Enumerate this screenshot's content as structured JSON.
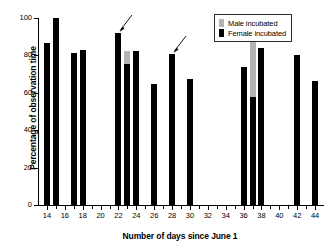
{
  "chart_data": {
    "type": "bar",
    "title": "",
    "xlabel": "Number of days since June 1",
    "ylabel": "Percentage of observation time",
    "xlim": [
      13,
      45
    ],
    "ylim": [
      0,
      100
    ],
    "grid": false,
    "stacked": true,
    "x_major_ticks": [
      14,
      16,
      18,
      20,
      22,
      24,
      26,
      28,
      30,
      32,
      34,
      36,
      38,
      40,
      42,
      44
    ],
    "x_minor_ticks": [
      15,
      17,
      19,
      21,
      23,
      25,
      27,
      29,
      31,
      33,
      35,
      37,
      39,
      41,
      43
    ],
    "x_tick_labels": [
      "14",
      "16",
      "18",
      "20",
      "22",
      "24",
      "26",
      "28",
      "30",
      "32",
      "34",
      "36",
      "38",
      "40",
      "42",
      "44"
    ],
    "y_ticks": [
      0,
      20,
      40,
      60,
      80,
      100
    ],
    "y_tick_labels": [
      "0",
      "20",
      "40",
      "60",
      "80",
      "100"
    ],
    "legend": {
      "position": "top-right",
      "entries": [
        {
          "name": "Male incubated",
          "color": "#b4b4b4"
        },
        {
          "name": "Female incubated",
          "color": "#000000"
        }
      ]
    },
    "series": [
      {
        "name": "Female incubated",
        "color": "#000000"
      },
      {
        "name": "Male incubated",
        "color": "#b4b4b4"
      }
    ],
    "categories": [
      14,
      15,
      17,
      18,
      22,
      23,
      24,
      26,
      28,
      30,
      36,
      37,
      38,
      42,
      44
    ],
    "bars": [
      {
        "day": 14,
        "female": 86.5,
        "male": 0,
        "total": 86.5
      },
      {
        "day": 15,
        "female": 100,
        "male": 0,
        "total": 100
      },
      {
        "day": 17,
        "female": 81.5,
        "male": 0,
        "total": 81.5
      },
      {
        "day": 18,
        "female": 83,
        "male": 0,
        "total": 83
      },
      {
        "day": 22,
        "female": 92,
        "male": 0,
        "total": 92
      },
      {
        "day": 23,
        "female": 75.5,
        "male": 7,
        "total": 82.5
      },
      {
        "day": 24,
        "female": 82.5,
        "male": 0,
        "total": 82.5
      },
      {
        "day": 26,
        "female": 64.5,
        "male": 0,
        "total": 64.5
      },
      {
        "day": 28,
        "female": 80.5,
        "male": 0,
        "total": 80.5
      },
      {
        "day": 30,
        "female": 67.5,
        "male": 0,
        "total": 67.5
      },
      {
        "day": 36,
        "female": 74,
        "male": 0,
        "total": 74
      },
      {
        "day": 37,
        "female": 58,
        "male": 30,
        "total": 88
      },
      {
        "day": 38,
        "female": 84,
        "male": 0,
        "total": 84
      },
      {
        "day": 42,
        "female": 80,
        "male": 0,
        "total": 80
      },
      {
        "day": 44,
        "female": 66.5,
        "male": 0,
        "total": 66.5
      }
    ],
    "annotations": [
      {
        "label": "arrow-to-day-22",
        "points_to_day": 22,
        "points_to_value": 92
      },
      {
        "label": "arrow-to-day-28",
        "points_to_day": 28,
        "points_to_value": 80.5
      }
    ]
  }
}
